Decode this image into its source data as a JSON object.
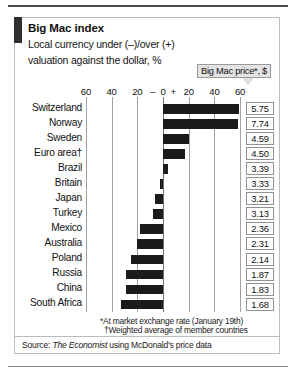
{
  "header": {
    "title": "Big Mac index",
    "subtitle_line1": "Local currency under (–)/over (+)",
    "subtitle_line2": "valuation against the dollar, %",
    "callout_label": "Big Mac price*, $"
  },
  "footnotes": {
    "note1": "*At market exchange rate (January 19th)",
    "note2": "†Weighted average of member countries",
    "source_prefix": "Source: ",
    "source_name": "The Economist",
    "source_suffix": " using McDonald's price data"
  },
  "chart_data": {
    "type": "bar",
    "orientation": "horizontal",
    "title": "Big Mac index",
    "subtitle": "Local currency under (–)/over (+) valuation against the dollar, %",
    "xlabel": "",
    "ylabel": "",
    "xlim": [
      -70,
      70
    ],
    "grid": true,
    "tick_labels": [
      "60",
      "40",
      "20",
      "–",
      "0",
      "+",
      "20",
      "40",
      "60"
    ],
    "tick_values": [
      -60,
      -40,
      -20,
      -8,
      0,
      8,
      20,
      40,
      60
    ],
    "gridline_values": [
      -60,
      -40,
      -20,
      0,
      20,
      40,
      60
    ],
    "categories": [
      "Switzerland",
      "Norway",
      "Sweden",
      "Euro area†",
      "Brazil",
      "Britain",
      "Japan",
      "Turkey",
      "Mexico",
      "Australia",
      "Poland",
      "Russia",
      "China",
      "South Africa"
    ],
    "values": [
      59,
      58,
      20,
      17,
      4,
      -2,
      -6,
      -8,
      -18,
      -20,
      -25,
      -29,
      -29,
      -33
    ],
    "series": [
      {
        "name": "Big Mac price*, $",
        "type": "labels",
        "values": [
          5.75,
          7.74,
          4.59,
          4.5,
          3.39,
          3.33,
          3.21,
          3.13,
          2.36,
          2.31,
          2.14,
          1.87,
          1.83,
          1.68
        ]
      }
    ],
    "price_labels": [
      "5.75",
      "7.74",
      "4.59",
      "4.50",
      "3.39",
      "3.33",
      "3.21",
      "3.13",
      "2.36",
      "2.31",
      "2.14",
      "1.87",
      "1.83",
      "1.68"
    ],
    "colors": {
      "bar": "#1b1b1b",
      "grid": "#9da0a4",
      "accent": "#2f2f2f"
    }
  }
}
